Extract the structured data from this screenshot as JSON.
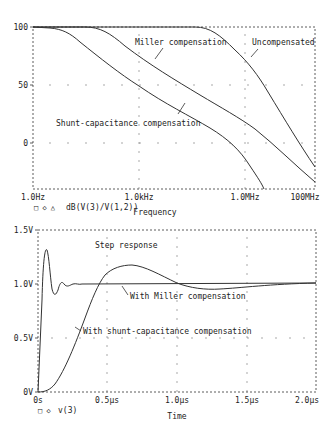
{
  "chart_data": [
    {
      "type": "line",
      "title": "",
      "xlabel": "Frequency",
      "ylabel": "",
      "xscale": "log",
      "xlim": [
        "1.0Hz",
        "100MHz"
      ],
      "ylim": [
        -40,
        100
      ],
      "x_ticks": [
        "1.0Hz",
        "1.0kHz",
        "1.0MHz",
        "100MHz"
      ],
      "y_ticks": [
        "100",
        "50",
        "0"
      ],
      "legend": "dB(V(3)/V(1,2))",
      "grid": "dotted",
      "x_log10_hz": [
        0,
        0.5,
        1,
        1.5,
        2,
        2.5,
        3,
        3.5,
        4,
        4.5,
        5,
        5.5,
        6,
        6.5,
        7,
        7.5,
        8
      ],
      "series": [
        {
          "name": "Shunt-capacitance compensation",
          "values": [
            100,
            99,
            95,
            86,
            76,
            66,
            57,
            47,
            37,
            28,
            19,
            9,
            -2,
            -18,
            -40,
            null,
            null
          ]
        },
        {
          "name": "Miller compensation",
          "values": [
            100,
            100,
            100,
            99,
            95,
            87,
            78,
            68,
            58,
            49,
            39,
            30,
            20,
            8,
            -7,
            -23,
            -40
          ]
        },
        {
          "name": "Uncompensated",
          "values": [
            100,
            100,
            100,
            100,
            100,
            100,
            100,
            100,
            100,
            99,
            95,
            87,
            77,
            60,
            40,
            14,
            -17
          ]
        }
      ],
      "annotations": [
        "Miller compensation",
        "Uncompensated",
        "Shunt-capacitance compensation"
      ]
    },
    {
      "type": "line",
      "title": "Step response",
      "xlabel": "Time",
      "ylabel": "",
      "xlim": [
        0,
        2.0
      ],
      "ylim": [
        0,
        1.5
      ],
      "x_unit": "µs",
      "x_ticks": [
        "0s",
        "0.5µs",
        "1.0µs",
        "1.5µs",
        "2.0µs"
      ],
      "y_ticks": [
        "1.5V",
        "1.0V",
        "0.5V",
        "0V"
      ],
      "legend": "v(3)",
      "grid": "dotted",
      "series": [
        {
          "name": "With Miller compensation",
          "x": [
            0,
            0.02,
            0.05,
            0.07,
            0.1,
            0.13,
            0.16,
            0.2,
            0.25,
            0.3,
            0.5,
            1.0,
            1.5,
            2.0
          ],
          "values": [
            0,
            0.8,
            1.3,
            1.2,
            0.9,
            0.95,
            1.03,
            1.0,
            1.0,
            1.0,
            1.0,
            1.0,
            1.01,
            1.02
          ]
        },
        {
          "name": "With shunt-capacitance compensation",
          "x": [
            0,
            0.1,
            0.2,
            0.3,
            0.4,
            0.5,
            0.6,
            0.7,
            0.8,
            0.9,
            1.0,
            1.1,
            1.2,
            1.3,
            1.5,
            1.7,
            2.0
          ],
          "values": [
            0,
            0.05,
            0.3,
            0.65,
            0.98,
            1.13,
            1.18,
            1.17,
            1.12,
            1.06,
            1.01,
            0.98,
            0.97,
            0.97,
            1.0,
            1.01,
            1.02
          ]
        }
      ],
      "annotations": [
        "Step response",
        "With Miller compensation",
        "With shunt-capacitance compensation"
      ]
    }
  ],
  "top": {
    "y_ticks": [
      "100",
      "50",
      "0"
    ],
    "x_ticks": [
      "1.0Hz",
      "1.0kHz",
      "1.0MHz",
      "100MHz"
    ],
    "legend_markers": "□  ◇  △",
    "legend_text": "dB(V(3)/V(1,2))",
    "xlabel": "Frequency",
    "ann_miller": "Miller compensation",
    "ann_uncomp": "Uncompensated",
    "ann_shunt": "Shunt-capacitance compensation"
  },
  "bottom": {
    "y_ticks": [
      "1.5V",
      "1.0V",
      "0.5V",
      "0V"
    ],
    "x_ticks": [
      "0s",
      "0.5µs",
      "1.0µs",
      "1.5µs",
      "2.0µs"
    ],
    "legend_markers": "□  ◇",
    "legend_text": "v(3)",
    "xlabel": "Time",
    "ann_title": "Step response",
    "ann_miller": "With Miller compensation",
    "ann_shunt": "With shunt-capacitance compensation"
  }
}
